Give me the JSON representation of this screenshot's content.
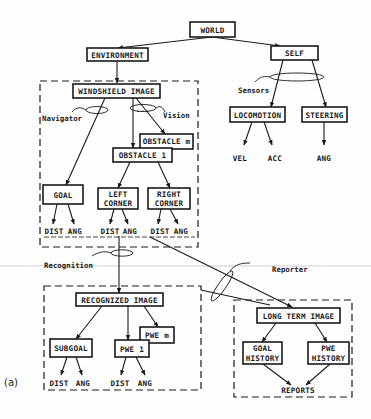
{
  "figure_label": "(a)",
  "nodes": {
    "world": "WORLD",
    "environment": "ENVIRONMENT",
    "self": "SELF",
    "windshield_image": "WINDSHIELD IMAGE",
    "locomotion": "LOCOMOTION",
    "steering": "STEERING",
    "obstacle_m": "OBSTACLE m",
    "obstacle_1": "OBSTACLE 1",
    "goal": "GOAL",
    "left_corner": [
      "LEFT",
      "CORNER"
    ],
    "right_corner": [
      "RIGHT",
      "CORNER"
    ],
    "recognized_image": "RECOGNIZED IMAGE",
    "subgoal": "SUBGOAL",
    "pwe_1": "PWE 1",
    "pwe_m": "PWE m",
    "long_term_image": "LONG TERM IMAGE",
    "goal_history": [
      "GOAL",
      "HISTORY"
    ],
    "pwe_history": [
      "PWE",
      "HISTORY"
    ]
  },
  "leaves": {
    "vel": "VEL",
    "acc": "ACC",
    "steer_ang": "ANG",
    "dist": "DIST",
    "ang": "ANG",
    "reports": "REPORTS",
    "ellipsis": "..."
  },
  "processes": {
    "navigator": "Navigator",
    "vision": "Vision",
    "sensors": "Sensors",
    "recognition": "Recognition",
    "reporter": "Reporter"
  }
}
